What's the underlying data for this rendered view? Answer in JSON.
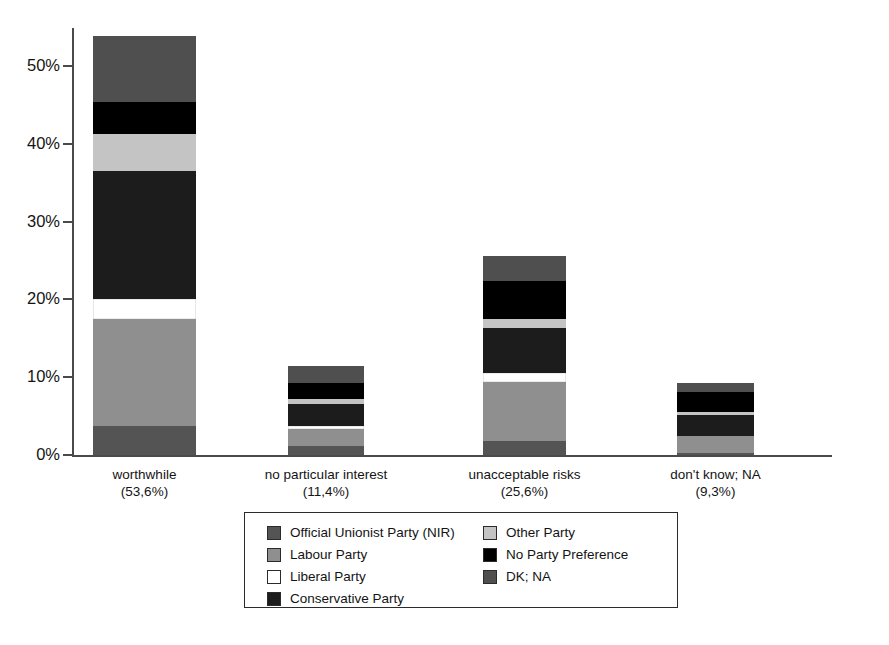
{
  "chart_data": {
    "type": "bar",
    "subtype": "stacked-bar",
    "title": "",
    "xlabel": "",
    "ylabel": "",
    "ylim": [
      0,
      57
    ],
    "grid": false,
    "legend_position": "bottom-center",
    "tick_labels": [
      "0%",
      "10%",
      "20%",
      "30%",
      "40%",
      "50%"
    ],
    "tick_values": [
      0,
      10,
      20,
      30,
      40,
      50
    ],
    "categories": [
      "worthwhile",
      "no particular interest",
      "unacceptable risks",
      "don't know; NA"
    ],
    "category_totals_label": [
      "(53,6%)",
      "(11,4%)",
      "(25,6%)",
      "(9,3%)"
    ],
    "category_totals": [
      53.6,
      11.4,
      25.6,
      9.3
    ],
    "series": [
      {
        "name": "Official Unionist Party (NIR)",
        "color": "#545454",
        "values": [
          3.7,
          1.2,
          1.8,
          0.2
        ]
      },
      {
        "name": "Labour Party",
        "color": "#8f8f8f",
        "values": [
          13.8,
          2.2,
          7.6,
          2.3
        ]
      },
      {
        "name": "Liberal Party",
        "color": "#ffffff",
        "values": [
          2.6,
          0.3,
          1.1,
          0.0
        ]
      },
      {
        "name": "Conservative Party",
        "color": "#1c1c1c",
        "values": [
          16.4,
          2.9,
          5.8,
          2.6
        ]
      },
      {
        "name": "Other Party",
        "color": "#c4c4c4",
        "values": [
          4.8,
          0.6,
          1.2,
          0.4
        ]
      },
      {
        "name": "No Party Preference",
        "color": "#000000",
        "values": [
          4.1,
          2.1,
          4.9,
          2.6
        ]
      },
      {
        "name": "DK; NA",
        "color": "#4f4f4f",
        "values": [
          8.4,
          2.2,
          3.2,
          1.2
        ]
      }
    ]
  },
  "legend": {
    "left_items": [
      {
        "label": "Official Unionist Party (NIR)",
        "color": "#545454"
      },
      {
        "label": "Labour Party",
        "color": "#8f8f8f"
      },
      {
        "label": "Liberal Party",
        "color": "#ffffff"
      },
      {
        "label": "Conservative Party",
        "color": "#1c1c1c"
      }
    ],
    "right_items": [
      {
        "label": "Other Party",
        "color": "#c4c4c4"
      },
      {
        "label": "No Party Preference",
        "color": "#000000"
      },
      {
        "label": "DK; NA",
        "color": "#4f4f4f"
      }
    ]
  }
}
